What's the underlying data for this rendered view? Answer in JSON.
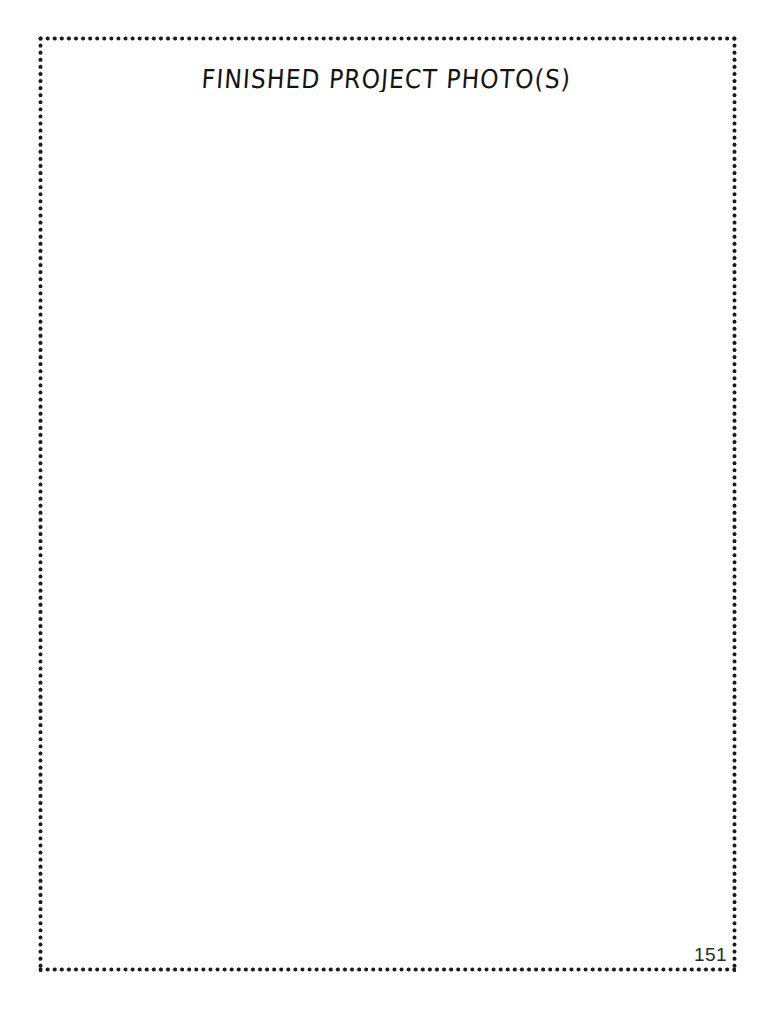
{
  "document": {
    "type": "worksheet-page",
    "background_color": "#ffffff",
    "border": {
      "style": "dotted",
      "color": "#1a1a1a"
    }
  },
  "heading": {
    "text": "FINISHED PROJECT PHOTO(S)"
  },
  "photo_area": {
    "content": ""
  },
  "footer": {
    "page_number": "151"
  }
}
